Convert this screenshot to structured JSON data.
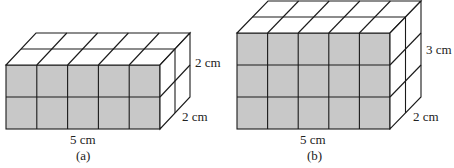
{
  "figures": [
    {
      "id": "a",
      "caption": "(a)",
      "length_label": "5 cm",
      "height_label": "2 cm",
      "depth_label": "2 cm",
      "cols": 5,
      "rows": 2,
      "depth": 2
    },
    {
      "id": "b",
      "caption": "(b)",
      "length_label": "5 cm",
      "height_label": "3 cm",
      "depth_label": "2 cm",
      "cols": 5,
      "rows": 3,
      "depth": 2
    }
  ],
  "colors": {
    "front_face": "#c8c8c8",
    "top_side_face": "#ffffff",
    "line": "#1a1a1a"
  }
}
